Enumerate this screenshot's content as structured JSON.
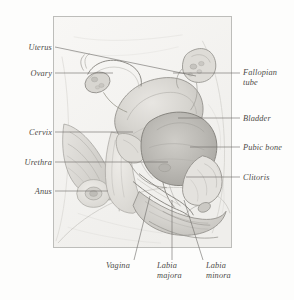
{
  "figure": {
    "style": "graphite pencil illustration",
    "frame": {
      "x": 53,
      "y": 16,
      "width": 179,
      "height": 232,
      "border_color": "#bdbdba",
      "fill_color": "#f7f6f4"
    }
  },
  "labels": {
    "uterus": "Uterus",
    "ovary": "Ovary",
    "cervix": "Cervix",
    "urethra": "Urethra",
    "anus": "Anus",
    "fallopian_tube_line1": "Fallopian",
    "fallopian_tube_line2": "tube",
    "bladder": "Bladder",
    "pubic_bone": "Pubic bone",
    "clitoris": "Clitoris",
    "vagina": "Vagina",
    "labia_majora_line1": "Labia",
    "labia_majora_line2": "majora",
    "labia_minora_line1": "Labia",
    "labia_minora_line2": "minora"
  },
  "colors": {
    "label_text": "#4c4a47",
    "leader_line": "#6b6966",
    "frame_border": "#bdbdba",
    "page_background": "#fdfdfc",
    "figure_background": "#f7f6f4",
    "organ_shade_light": "#e2e0dc",
    "organ_shade_mid": "#c9c7c2",
    "organ_shade_dark": "#aeaca7",
    "outline": "#8d8b86"
  }
}
